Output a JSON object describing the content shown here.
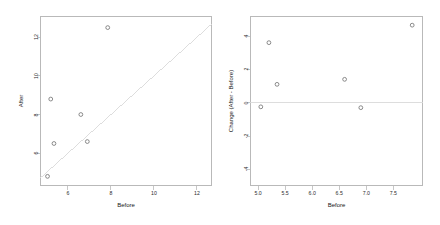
{
  "figure": {
    "background": "#ffffff",
    "panel_count": 2,
    "point_color": "#6e6e6e",
    "axis_color": "#b9b9b9",
    "reference_line_color": "#d9d9d9"
  },
  "chart_data": [
    {
      "type": "scatter",
      "panel": "left",
      "title": "",
      "xlabel": "Before",
      "ylabel": "After",
      "xlim": [
        4.7,
        12.7
      ],
      "ylim": [
        4.3,
        13.1
      ],
      "xticks": [
        6,
        8,
        10,
        12
      ],
      "xticklabels": [
        "6",
        "8",
        "10",
        "12"
      ],
      "yticks": [
        6,
        8,
        10,
        12
      ],
      "yticklabels": [
        "6",
        "8",
        "10",
        "12"
      ],
      "grid": false,
      "legend": false,
      "annotations": [
        {
          "type": "reference-line",
          "description": "identity line y = x",
          "style": "solid",
          "color": "#d9d9d9"
        }
      ],
      "x": [
        5.05,
        5.2,
        5.35,
        6.6,
        6.9,
        7.85
      ],
      "y": [
        4.8,
        8.8,
        6.5,
        8.0,
        6.6,
        12.5
      ],
      "marker": "open-circle"
    },
    {
      "type": "scatter",
      "panel": "right",
      "title": "",
      "xlabel": "Before",
      "ylabel": "Change (After - Before)",
      "xlim": [
        4.85,
        8.05
      ],
      "ylim": [
        -5.0,
        5.2
      ],
      "xticks": [
        5.0,
        5.5,
        6.0,
        6.5,
        7.0,
        7.5
      ],
      "xticklabels": [
        "5.0",
        "5.5",
        "6.0",
        "6.5",
        "7.0",
        "7.5"
      ],
      "yticks": [
        -4,
        -2,
        0,
        2,
        4
      ],
      "yticklabels": [
        "-4",
        "-2",
        "0",
        "2",
        "4"
      ],
      "grid": false,
      "legend": false,
      "annotations": [
        {
          "type": "reference-line",
          "description": "horizontal zero line",
          "value": 0,
          "style": "solid",
          "color": "#d9d9d9"
        }
      ],
      "x": [
        5.05,
        5.2,
        5.35,
        6.6,
        6.9,
        7.85
      ],
      "y": [
        -0.25,
        3.6,
        1.1,
        1.4,
        -0.3,
        4.65
      ],
      "marker": "open-circle"
    }
  ],
  "left_panel": {
    "x_axis_title": "Before",
    "y_axis_title": "After",
    "x_tick_labels": [
      "6",
      "8",
      "10",
      "12"
    ],
    "y_tick_labels": [
      "6",
      "8",
      "10",
      "12"
    ]
  },
  "right_panel": {
    "x_axis_title": "Before",
    "y_axis_title": "Change (After - Before)",
    "x_tick_labels": [
      "5.0",
      "5.5",
      "6.0",
      "6.5",
      "7.0",
      "7.5"
    ],
    "y_tick_labels": [
      "-4",
      "-2",
      "0",
      "2",
      "4"
    ]
  }
}
